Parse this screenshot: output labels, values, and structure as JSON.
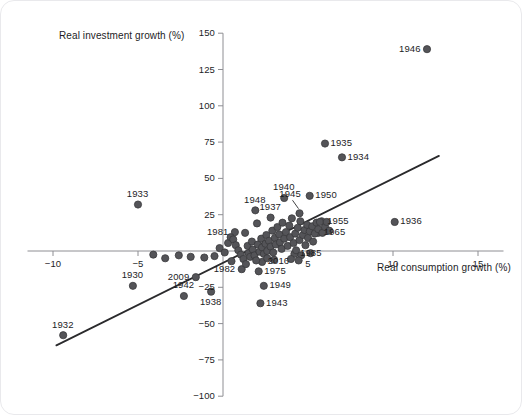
{
  "figure": {
    "background": "#ffffff",
    "marker_color": "#545458",
    "marker_edge": "#3a3a3c",
    "axis_color": "#8e8e93",
    "line_color": "#2b2b2d",
    "text_color": "#1d1d1f"
  },
  "chart_data": {
    "type": "scatter",
    "title": "",
    "xlabel": "Real consumption growth (%)",
    "ylabel": "Real investment growth (%)",
    "xlim": [
      -11.5,
      16.5
    ],
    "ylim": [
      -100,
      150
    ],
    "xticks": [
      -10,
      -5,
      5,
      10,
      15
    ],
    "xticklabels": [
      "−10",
      "−5",
      "5",
      "10",
      "15"
    ],
    "yticks": [
      -100,
      -75,
      -50,
      -25,
      25,
      50,
      75,
      100,
      125,
      150
    ],
    "yticklabels": [
      "−100",
      "−75",
      "−50",
      "−25",
      "25",
      "50",
      "75",
      "100",
      "125",
      "150"
    ],
    "grid": false,
    "legend": null,
    "axes_at_origin": true,
    "trendline": {
      "label": "linear fit",
      "x_start": -9.8,
      "y_start": -65.0,
      "x_end": 12.7,
      "y_end": 65.5
    },
    "points": [
      {
        "label": "1946",
        "x": 12.0,
        "y": 139.0,
        "label_pos": "left"
      },
      {
        "label": "1935",
        "x": 6.0,
        "y": 74.0,
        "label_pos": "right"
      },
      {
        "label": "1934",
        "x": 7.0,
        "y": 64.5,
        "label_pos": "right"
      },
      {
        "label": "1933",
        "x": -5.0,
        "y": 32.0,
        "label_pos": "above"
      },
      {
        "label": "1950",
        "x": 5.1,
        "y": 38.0,
        "label_pos": "right"
      },
      {
        "label": "1945",
        "x": 4.5,
        "y": 26.0,
        "label_pos": "leader-up"
      },
      {
        "label": "1940",
        "x": 3.6,
        "y": 36.5,
        "label_pos": "above"
      },
      {
        "label": "1948",
        "x": 1.9,
        "y": 28.0,
        "label_pos": "above"
      },
      {
        "label": "1937",
        "x": 2.8,
        "y": 23.0,
        "label_pos": "above"
      },
      {
        "label": "1936",
        "x": 10.1,
        "y": 20.0,
        "label_pos": "right"
      },
      {
        "label": "1955",
        "x": 5.8,
        "y": 20.5,
        "label_pos": "right"
      },
      {
        "label": "1965",
        "x": 5.6,
        "y": 12.5,
        "label_pos": "right"
      },
      {
        "label": "1981",
        "x": 0.7,
        "y": 13.0,
        "label_pos": "left"
      },
      {
        "label": "1985",
        "x": 4.2,
        "y": -2.0,
        "label_pos": "right"
      },
      {
        "label": "2016",
        "x": 2.3,
        "y": -7.5,
        "label_pos": "right"
      },
      {
        "label": "1982",
        "x": 1.1,
        "y": -12.5,
        "label_pos": "left"
      },
      {
        "label": "1975",
        "x": 2.1,
        "y": -14.0,
        "label_pos": "right"
      },
      {
        "label": "1949",
        "x": 2.4,
        "y": -24.0,
        "label_pos": "right"
      },
      {
        "label": "1943",
        "x": 2.2,
        "y": -36.0,
        "label_pos": "right"
      },
      {
        "label": "2009",
        "x": -1.6,
        "y": -18.0,
        "label_pos": "left"
      },
      {
        "label": "1938",
        "x": -0.7,
        "y": -28.0,
        "label_pos": "below"
      },
      {
        "label": "1942",
        "x": -2.3,
        "y": -31.0,
        "label_pos": "above"
      },
      {
        "label": "1930",
        "x": -5.3,
        "y": -24.0,
        "label_pos": "above"
      },
      {
        "label": "1932",
        "x": -9.4,
        "y": -58.0,
        "label_pos": "above"
      },
      {
        "label": "",
        "x": -4.1,
        "y": -2.5
      },
      {
        "label": "",
        "x": -3.4,
        "y": -5.0
      },
      {
        "label": "",
        "x": -2.6,
        "y": -3.0
      },
      {
        "label": "",
        "x": -1.9,
        "y": -4.0
      },
      {
        "label": "",
        "x": -1.1,
        "y": -4.5
      },
      {
        "label": "",
        "x": -0.5,
        "y": -3.5
      },
      {
        "label": "",
        "x": -0.2,
        "y": 2.0
      },
      {
        "label": "",
        "x": 0.1,
        "y": -1.0
      },
      {
        "label": "",
        "x": 0.3,
        "y": 5.5
      },
      {
        "label": "",
        "x": 0.45,
        "y": 9.5
      },
      {
        "label": "",
        "x": 0.6,
        "y": 8.0
      },
      {
        "label": "",
        "x": 0.75,
        "y": 4.0
      },
      {
        "label": "",
        "x": 0.9,
        "y": 0.5
      },
      {
        "label": "",
        "x": 1.05,
        "y": -2.5
      },
      {
        "label": "",
        "x": 1.2,
        "y": -5.5
      },
      {
        "label": "",
        "x": 1.3,
        "y": 12.5
      },
      {
        "label": "",
        "x": 1.45,
        "y": 3.5
      },
      {
        "label": "",
        "x": 1.5,
        "y": -1.5
      },
      {
        "label": "",
        "x": 1.6,
        "y": -4.0
      },
      {
        "label": "",
        "x": 1.7,
        "y": 6.5
      },
      {
        "label": "",
        "x": 1.75,
        "y": 1.0
      },
      {
        "label": "",
        "x": 1.85,
        "y": -3.0
      },
      {
        "label": "",
        "x": 1.95,
        "y": -6.5
      },
      {
        "label": "",
        "x": 2.0,
        "y": 19.0
      },
      {
        "label": "",
        "x": 2.05,
        "y": 4.5
      },
      {
        "label": "",
        "x": 2.15,
        "y": -0.5
      },
      {
        "label": "",
        "x": 2.25,
        "y": 8.5
      },
      {
        "label": "",
        "x": 2.3,
        "y": 2.5
      },
      {
        "label": "",
        "x": 2.4,
        "y": -2.0
      },
      {
        "label": "",
        "x": 2.5,
        "y": 5.0
      },
      {
        "label": "",
        "x": 2.55,
        "y": 11.0
      },
      {
        "label": "",
        "x": 2.6,
        "y": 0.0
      },
      {
        "label": "",
        "x": 2.7,
        "y": 7.0
      },
      {
        "label": "",
        "x": 2.8,
        "y": 3.0
      },
      {
        "label": "",
        "x": 2.9,
        "y": 14.0
      },
      {
        "label": "",
        "x": 2.95,
        "y": -1.0
      },
      {
        "label": "",
        "x": 3.05,
        "y": 9.0
      },
      {
        "label": "",
        "x": 3.1,
        "y": 4.5
      },
      {
        "label": "",
        "x": 3.2,
        "y": 16.5
      },
      {
        "label": "",
        "x": 3.3,
        "y": 11.5
      },
      {
        "label": "",
        "x": 3.35,
        "y": 6.0
      },
      {
        "label": "",
        "x": 3.45,
        "y": 1.5
      },
      {
        "label": "",
        "x": 3.5,
        "y": 19.5
      },
      {
        "label": "",
        "x": 3.6,
        "y": 8.5
      },
      {
        "label": "",
        "x": 3.7,
        "y": 13.0
      },
      {
        "label": "",
        "x": 3.8,
        "y": 3.5
      },
      {
        "label": "",
        "x": 3.9,
        "y": 17.5
      },
      {
        "label": "",
        "x": 3.95,
        "y": 9.5
      },
      {
        "label": "",
        "x": 4.05,
        "y": 22.5
      },
      {
        "label": "",
        "x": 4.15,
        "y": 5.5
      },
      {
        "label": "",
        "x": 4.25,
        "y": 12.0
      },
      {
        "label": "",
        "x": 4.3,
        "y": 0.5
      },
      {
        "label": "",
        "x": 4.4,
        "y": 16.0
      },
      {
        "label": "",
        "x": 4.5,
        "y": 7.5
      },
      {
        "label": "",
        "x": 4.55,
        "y": 20.5
      },
      {
        "label": "",
        "x": 4.6,
        "y": -3.0
      },
      {
        "label": "",
        "x": 4.7,
        "y": 11.0
      },
      {
        "label": "",
        "x": 4.8,
        "y": 14.5
      },
      {
        "label": "",
        "x": 4.85,
        "y": 4.0
      },
      {
        "label": "",
        "x": 4.95,
        "y": 18.0
      },
      {
        "label": "",
        "x": 5.0,
        "y": 9.0
      },
      {
        "label": "",
        "x": 5.1,
        "y": 13.5
      },
      {
        "label": "",
        "x": 5.15,
        "y": -1.5
      },
      {
        "label": "",
        "x": 5.25,
        "y": 17.0
      },
      {
        "label": "",
        "x": 5.3,
        "y": 6.5
      },
      {
        "label": "",
        "x": 5.4,
        "y": 12.0
      },
      {
        "label": "",
        "x": 5.5,
        "y": 19.5
      },
      {
        "label": "",
        "x": 5.6,
        "y": 15.0
      },
      {
        "label": "",
        "x": 5.7,
        "y": 20.0
      },
      {
        "label": "",
        "x": 5.85,
        "y": 12.5
      },
      {
        "label": "",
        "x": 6.0,
        "y": 16.5
      },
      {
        "label": "",
        "x": 6.1,
        "y": 20.0
      },
      {
        "label": "",
        "x": 6.25,
        "y": 14.0
      },
      {
        "label": "",
        "x": 1.35,
        "y": -9.0
      },
      {
        "label": "",
        "x": 0.5,
        "y": -7.0
      },
      {
        "label": "",
        "x": 2.6,
        "y": -5.0
      },
      {
        "label": "",
        "x": 3.0,
        "y": -6.0
      },
      {
        "label": "",
        "x": 4.0,
        "y": -5.5
      },
      {
        "label": "",
        "x": 4.45,
        "y": -6.5
      }
    ]
  }
}
